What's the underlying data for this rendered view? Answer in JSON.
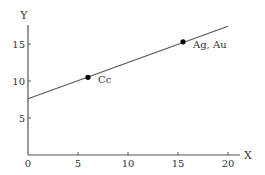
{
  "chart_data": {
    "type": "line",
    "title": "",
    "xlabel": "X",
    "ylabel": "Y",
    "xlim": [
      0,
      21
    ],
    "ylim": [
      0,
      17.5
    ],
    "x_ticks": [
      0,
      5,
      10,
      15,
      20
    ],
    "y_ticks": [
      5,
      10,
      15
    ],
    "x_tick_labels": [
      "0",
      "5",
      "10",
      "15",
      "20"
    ],
    "y_tick_labels": [
      "5",
      "10",
      "15"
    ],
    "grid": false,
    "legend": null,
    "series": [
      {
        "name": "trend line",
        "x": [
          0,
          20
        ],
        "y": [
          7.6,
          17.4
        ],
        "color": "#555555"
      }
    ],
    "points": [
      {
        "label": "Cc",
        "x": 6,
        "y": 10.5
      },
      {
        "label": "Ag, Au",
        "x": 15.5,
        "y": 15.3
      }
    ],
    "colors": {
      "axis": "#555555",
      "line": "#555555",
      "point": "#000000",
      "text": "#333333"
    }
  }
}
